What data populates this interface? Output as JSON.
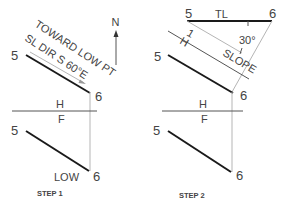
{
  "colors": {
    "object_line": "#1a1a1a",
    "construction_line": "#b5b5b5",
    "text": "#444444"
  },
  "step1": {
    "caption": "STEP 1",
    "north_label": "N",
    "text_toward": "TOWARD LOW PT",
    "text_sl_dir": "SL DIR S 60°E",
    "top_point_5": "5",
    "top_point_6": "6",
    "fold_h": "H",
    "fold_f": "F",
    "front_point_5": "5",
    "front_point_6": "6",
    "low_label": "LOW"
  },
  "step2": {
    "caption": "STEP 2",
    "tl_point_5": "5",
    "tl_label": "TL",
    "tl_point_6": "6",
    "angle_label": "30°",
    "fold_h": "H",
    "fold_1": "1",
    "slope_label": "SLOPE",
    "top_point_5": "5",
    "top_point_6": "6",
    "fold_h2": "H",
    "fold_f": "F",
    "front_point_5": "5",
    "front_point_6": "6"
  }
}
